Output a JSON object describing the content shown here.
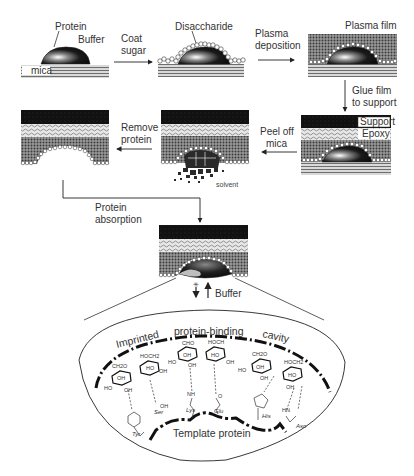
{
  "steps": {
    "step1": {
      "protein": "Protein",
      "buffer": "Buffer",
      "mica": "mica"
    },
    "arrow1": {
      "line1": "Coat",
      "line2": "sugar"
    },
    "step2": {
      "disaccharide": "Disaccharide"
    },
    "arrow2": {
      "line1": "Plasma",
      "line2": "deposition"
    },
    "step3": {
      "plasma_film": "Plasma film"
    },
    "arrow3": {
      "line1": "Glue film",
      "line2": "to support"
    },
    "step4": {
      "support": "Support",
      "epoxy": "Epoxy"
    },
    "arrow4": {
      "line1": "Peel off",
      "line2": "mica"
    },
    "step5": {
      "solvent": "solvent"
    },
    "arrow5": {
      "line1": "Remove",
      "line2": "protein"
    },
    "arrow6": {
      "line1": "Protein",
      "line2": "absorption"
    },
    "step7": {
      "buffer": "Buffer",
      "blocked_symbol": "✳"
    }
  },
  "detail": {
    "cavity_label_1": "Imprinted",
    "cavity_label_2": "protein-binding",
    "cavity_label_3": "cavity",
    "template_label": "Template protein",
    "residues": [
      "Tyr",
      "Ser",
      "Lys",
      "Glu",
      "His",
      "Asn"
    ],
    "groups": {
      "ch2o_1": "CH2O",
      "hoch2_1": "HOCH2",
      "cho": "CHO",
      "hoch": "HOCH",
      "ch2o_2": "CH2O",
      "hoch2_2": "HOCH2",
      "oh": "OH",
      "ho": "HO",
      "nh": "NH",
      "hn": "HN",
      "o": "O",
      "oh_ser": "OH"
    }
  },
  "colors": {
    "support": "#0d0d0d",
    "epoxy": "#bdbdbd",
    "plasma": "#6b6b6b",
    "mica_line": "#7a7a7a",
    "protein": "#151515",
    "sugar": "#ffffff",
    "line": "#333333"
  }
}
